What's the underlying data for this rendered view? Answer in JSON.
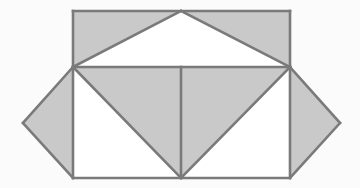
{
  "figure": {
    "canvas": {
      "width": 360,
      "height": 188
    },
    "colors": {
      "background": "#fbfbfb",
      "shaded_fill": "#c9c9c9",
      "unshaded_fill": "#ffffff",
      "stroke": "#7a7a7a"
    },
    "stroke_width": 2.6,
    "vertices": {
      "top_apex": [
        181,
        11
      ],
      "top_left": [
        73,
        11
      ],
      "top_right": [
        290,
        11
      ],
      "mid_left": [
        73,
        67
      ],
      "mid_right": [
        290,
        67
      ],
      "bottom_left": [
        73,
        178
      ],
      "bottom_mid": [
        181,
        178
      ],
      "bottom_right": [
        290,
        178
      ],
      "left_wing_point": [
        23,
        123
      ],
      "right_wing_point": [
        340,
        123
      ]
    },
    "regions": [
      {
        "name": "upper-left-shaded-triangle",
        "points": "73,11 181,11 73,67",
        "fill": "shaded"
      },
      {
        "name": "upper-right-shaded-triangle",
        "points": "181,11 290,11 290,67",
        "fill": "shaded"
      },
      {
        "name": "upper-white-triangle",
        "points": "73,67 181,11 290,67",
        "fill": "unshaded"
      },
      {
        "name": "central-left-shaded-triangle",
        "points": "73,67 181,67 181,178",
        "fill": "shaded"
      },
      {
        "name": "central-right-shaded-triangle",
        "points": "181,67 290,67 181,178",
        "fill": "shaded"
      },
      {
        "name": "lower-left-white-triangle",
        "points": "73,67 181,178 73,178",
        "fill": "unshaded"
      },
      {
        "name": "lower-right-white-triangle",
        "points": "290,67 290,178 181,178",
        "fill": "unshaded"
      },
      {
        "name": "left-wing-diamond",
        "points": "73,67 73,178 23,123",
        "fill": "shaded"
      },
      {
        "name": "right-wing-diamond",
        "points": "290,67 340,123 290,178",
        "fill": "shaded"
      }
    ],
    "edges": [
      {
        "name": "upper-rect-top",
        "x1": 73,
        "y1": 11,
        "x2": 290,
        "y2": 11
      },
      {
        "name": "upper-rect-left",
        "x1": 73,
        "y1": 11,
        "x2": 73,
        "y2": 67
      },
      {
        "name": "upper-rect-right",
        "x1": 290,
        "y1": 11,
        "x2": 290,
        "y2": 67
      },
      {
        "name": "hypotenuse-left",
        "x1": 73,
        "y1": 67,
        "x2": 181,
        "y2": 11
      },
      {
        "name": "hypotenuse-right",
        "x1": 181,
        "y1": 11,
        "x2": 290,
        "y2": 67
      },
      {
        "name": "middle-horizontal",
        "x1": 73,
        "y1": 67,
        "x2": 290,
        "y2": 67
      },
      {
        "name": "vertical-median",
        "x1": 181,
        "y1": 67,
        "x2": 181,
        "y2": 178
      },
      {
        "name": "lower-rect-left",
        "x1": 73,
        "y1": 67,
        "x2": 73,
        "y2": 178
      },
      {
        "name": "lower-rect-right",
        "x1": 290,
        "y1": 67,
        "x2": 290,
        "y2": 178
      },
      {
        "name": "lower-rect-bottom",
        "x1": 73,
        "y1": 178,
        "x2": 290,
        "y2": 178
      },
      {
        "name": "diagonal-left-down",
        "x1": 73,
        "y1": 67,
        "x2": 181,
        "y2": 178
      },
      {
        "name": "diagonal-right-down",
        "x1": 290,
        "y1": 67,
        "x2": 181,
        "y2": 178
      },
      {
        "name": "left-wing-upper-edge",
        "x1": 73,
        "y1": 67,
        "x2": 23,
        "y2": 123
      },
      {
        "name": "left-wing-lower-edge",
        "x1": 23,
        "y1": 123,
        "x2": 73,
        "y2": 178
      },
      {
        "name": "right-wing-upper-edge",
        "x1": 290,
        "y1": 67,
        "x2": 340,
        "y2": 123
      },
      {
        "name": "right-wing-lower-edge",
        "x1": 340,
        "y1": 123,
        "x2": 290,
        "y2": 178
      }
    ]
  }
}
